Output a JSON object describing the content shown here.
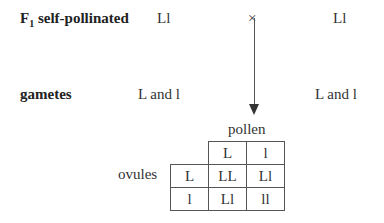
{
  "row1": {
    "label_main": "F",
    "label_sub": "1",
    "label_rest": " self-pollinated",
    "parent1": "Ll",
    "cross": "×",
    "parent2": "Ll"
  },
  "row2": {
    "label": "gametes",
    "gametes1": "L and l",
    "gametes2": "L and l"
  },
  "punnett": {
    "pollen_label": "pollen",
    "ovules_label": "ovules",
    "pollen": [
      "L",
      "l"
    ],
    "ovules": [
      "L",
      "l"
    ],
    "cells": [
      [
        "LL",
        "Ll"
      ],
      [
        "Ll",
        "ll"
      ]
    ]
  }
}
